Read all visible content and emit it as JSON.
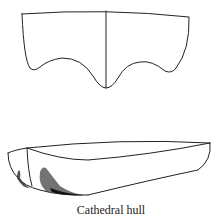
{
  "diagram": {
    "subject": "Cathedral hull",
    "views": [
      {
        "name": "cross-section",
        "description": "Transverse section of a cathedral hull with a central keel line and two bilge bumps"
      },
      {
        "name": "perspective",
        "description": "Perspective view of the cathedral hull showing the bow with shaded sponsons"
      }
    ],
    "stroke_color": "#222222",
    "background": "#ffffff"
  },
  "caption": "Cathedral hull"
}
